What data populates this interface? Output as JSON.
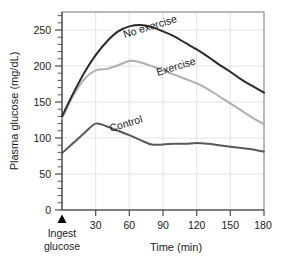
{
  "chart_data": {
    "type": "line",
    "title": "",
    "xlabel": "Time (min)",
    "ylabel": "Plasma glucose (mg/dL)",
    "xlim": [
      0,
      180
    ],
    "ylim": [
      0,
      275
    ],
    "grid": true,
    "legend_position": "inline-curve-labels",
    "x_ticks": [
      0,
      30,
      60,
      90,
      120,
      150,
      180
    ],
    "x_tick_labels": [
      "",
      "30",
      "60",
      "90",
      "120",
      "150",
      "180"
    ],
    "y_ticks": [
      0,
      50,
      100,
      150,
      200,
      250
    ],
    "y_tick_labels": [
      "0",
      "50",
      "100",
      "150",
      "200",
      "250"
    ],
    "y_minor_tick_step": 10,
    "x": [
      0,
      10,
      20,
      30,
      40,
      50,
      60,
      70,
      80,
      90,
      100,
      110,
      120,
      130,
      140,
      150,
      160,
      170,
      180
    ],
    "series": [
      {
        "name": "No exercise",
        "color": "#2b2b2b",
        "values": [
          130,
          162,
          191,
          215,
          234,
          248,
          255,
          257,
          254,
          248,
          241,
          232,
          223,
          213,
          202,
          192,
          181,
          172,
          163
        ]
      },
      {
        "name": "Exercise",
        "color": "#b0b0b0",
        "values": [
          127,
          159,
          182,
          194,
          196,
          201,
          207,
          205,
          200,
          194,
          188,
          182,
          176,
          168,
          158,
          148,
          138,
          128,
          119
        ]
      },
      {
        "name": "Control",
        "color": "#595959",
        "values": [
          79,
          93,
          107,
          120,
          116,
          110,
          104,
          97,
          91,
          91,
          92,
          92,
          93,
          92,
          90,
          88,
          86,
          84,
          81
        ]
      }
    ],
    "annotations": [
      {
        "name": "ingest-glucose-marker",
        "marker": "triangle-up",
        "color": "#000000",
        "x": 0,
        "label_line_1": "Ingest",
        "label_line_2": "glucose"
      }
    ]
  },
  "series_labels": {
    "no_exercise": "No exercise",
    "exercise": "Exercise",
    "control": "Control"
  },
  "axes": {
    "y_title": "Plasma glucose (mg/dL)",
    "x_title": "Time (min)"
  },
  "y_labels": {
    "t0": "0",
    "t50": "50",
    "t100": "100",
    "t150": "150",
    "t200": "200",
    "t250": "250"
  },
  "x_labels": {
    "t30": "30",
    "t60": "60",
    "t90": "90",
    "t120": "120",
    "t150": "150",
    "t180": "180"
  },
  "annotation": {
    "ingest_line1": "Ingest",
    "ingest_line2": "glucose"
  },
  "colors": {
    "no_exercise": "#2b2b2b",
    "exercise": "#b0b0b0",
    "control": "#595959",
    "grid": "#dcdcdc",
    "frame": "#8a8a8a",
    "axis": "#4a4a4a",
    "text": "#1a1a1a"
  }
}
